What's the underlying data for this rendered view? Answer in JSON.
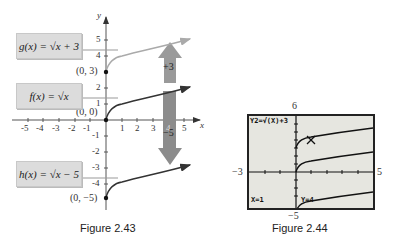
{
  "figure_43": {
    "caption": "Figure 2.43",
    "axis_x_label": "x",
    "axis_y_label": "y",
    "x_ticks": [
      "-5",
      "-4",
      "-3",
      "-2",
      "-1",
      "1",
      "2",
      "3",
      "4",
      "5"
    ],
    "y_ticks": [
      "5",
      "4",
      "3",
      "2",
      "1",
      "-1",
      "-2",
      "-3",
      "-4"
    ],
    "labels": {
      "g": "g(x) = √x + 3",
      "f": "f(x) = √x",
      "h": "h(x) = √x − 5"
    },
    "points": {
      "g": "(0, 3)",
      "f": "(0, 0)",
      "h": "(0, −5)"
    },
    "shift_up_label": "+3",
    "shift_down_label": "−5",
    "colors": {
      "g_curve": "#aaaaaa",
      "f_curve": "#333333",
      "h_curve": "#333333",
      "arrow": "#9a9a9a",
      "label_box": "#dcdcdc"
    }
  },
  "figure_44": {
    "caption": "Figure 2.44",
    "equation": "Y2=√(X)+3",
    "x_readout": "X=1",
    "y_readout": "Y=4",
    "window": {
      "ymax": "6",
      "ymin": "−5",
      "xmin": "−3",
      "xmax": "5"
    }
  }
}
